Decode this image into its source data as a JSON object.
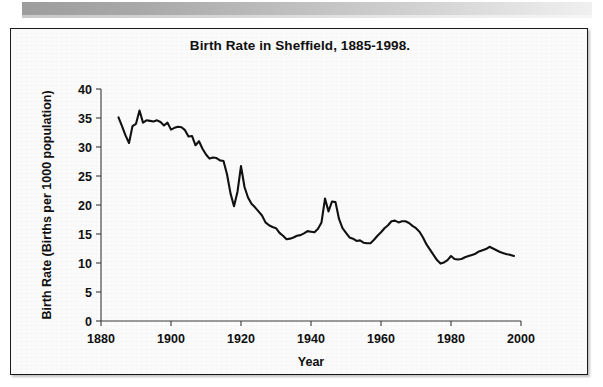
{
  "page": {
    "background_color": "#ffffff",
    "scan_band_color": "#9d9d9d"
  },
  "chart_frame": {
    "border_color": "#1a1a1a",
    "background_color": "#fbfbfb"
  },
  "chart_data": {
    "type": "line",
    "title": "Birth Rate in Sheffield, 1885-1998.",
    "xlabel": "Year",
    "ylabel": "Birth Rate (Births per 1000 population)",
    "xlim": [
      1880,
      2000
    ],
    "ylim": [
      0,
      40
    ],
    "xticks": [
      1880,
      1900,
      1920,
      1940,
      1960,
      1980,
      2000
    ],
    "xtick_labels": [
      "1880",
      "1900",
      "1920",
      "1940",
      "1960",
      "1980",
      "2000"
    ],
    "yticks": [
      0,
      5,
      10,
      15,
      20,
      25,
      30,
      35,
      40
    ],
    "ytick_labels": [
      "0",
      "5",
      "10",
      "15",
      "20",
      "25",
      "30",
      "35",
      "40"
    ],
    "grid": false,
    "legend": "none",
    "line_color": "#111111",
    "series": [
      {
        "name": "Birth Rate",
        "x": [
          1885,
          1886,
          1887,
          1888,
          1889,
          1890,
          1891,
          1892,
          1893,
          1894,
          1895,
          1896,
          1897,
          1898,
          1899,
          1900,
          1901,
          1902,
          1903,
          1904,
          1905,
          1906,
          1907,
          1908,
          1909,
          1910,
          1911,
          1912,
          1913,
          1914,
          1915,
          1916,
          1917,
          1918,
          1919,
          1920,
          1921,
          1922,
          1923,
          1924,
          1925,
          1926,
          1927,
          1928,
          1929,
          1930,
          1931,
          1932,
          1933,
          1934,
          1935,
          1936,
          1937,
          1938,
          1939,
          1940,
          1941,
          1942,
          1943,
          1944,
          1945,
          1946,
          1947,
          1948,
          1949,
          1950,
          1951,
          1952,
          1953,
          1954,
          1955,
          1956,
          1957,
          1958,
          1959,
          1960,
          1961,
          1962,
          1963,
          1964,
          1965,
          1966,
          1967,
          1968,
          1969,
          1970,
          1971,
          1972,
          1973,
          1974,
          1975,
          1976,
          1977,
          1978,
          1979,
          1980,
          1981,
          1982,
          1983,
          1984,
          1985,
          1986,
          1987,
          1988,
          1989,
          1990,
          1991,
          1992,
          1993,
          1994,
          1995,
          1996,
          1997,
          1998
        ],
        "values": [
          35.1,
          33.6,
          32.0,
          30.7,
          33.6,
          34.0,
          36.3,
          34.2,
          34.6,
          34.5,
          34.4,
          34.6,
          34.3,
          33.7,
          34.2,
          33.0,
          33.3,
          33.5,
          33.4,
          32.9,
          31.8,
          31.9,
          30.3,
          31.0,
          29.7,
          28.7,
          28.0,
          28.2,
          28.1,
          27.7,
          27.6,
          25.3,
          22.0,
          19.8,
          22.3,
          26.7,
          23.1,
          21.3,
          20.2,
          19.6,
          18.9,
          18.2,
          17.0,
          16.5,
          16.2,
          16.0,
          15.2,
          14.7,
          14.1,
          14.2,
          14.4,
          14.7,
          14.8,
          15.1,
          15.5,
          15.4,
          15.3,
          15.9,
          17.0,
          21.1,
          18.9,
          20.6,
          20.5,
          17.6,
          16.0,
          15.2,
          14.4,
          14.2,
          13.8,
          13.9,
          13.5,
          13.4,
          13.4,
          14.0,
          14.7,
          15.3,
          16.0,
          16.5,
          17.2,
          17.3,
          17.0,
          17.2,
          17.2,
          16.9,
          16.4,
          16.0,
          15.4,
          14.4,
          13.2,
          12.3,
          11.4,
          10.5,
          9.9,
          10.1,
          10.5,
          11.2,
          10.7,
          10.6,
          10.7,
          11.0,
          11.2,
          11.4,
          11.6,
          12.0,
          12.2,
          12.4,
          12.8,
          12.5,
          12.2,
          11.9,
          11.7,
          11.5,
          11.4,
          11.2
        ]
      }
    ]
  }
}
